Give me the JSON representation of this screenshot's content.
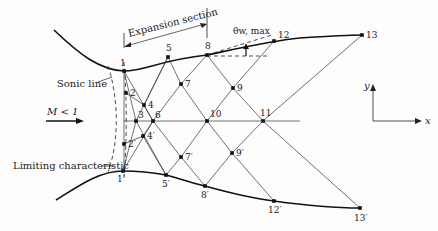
{
  "labels": {
    "expansion_section": "Expansion section",
    "sonic_line": "Sonic line",
    "limiting_characteristic": "Limiting characteristic",
    "mach": "M < 1",
    "theta": "θw, max",
    "axis_x": "x",
    "axis_y": "y"
  },
  "points": [
    {
      "id": "1",
      "x": 124,
      "y": 71
    },
    {
      "id": "2",
      "x": 126,
      "y": 93
    },
    {
      "id": "3",
      "x": 136,
      "y": 121
    },
    {
      "id": "4",
      "x": 144,
      "y": 105
    },
    {
      "id": "5",
      "x": 168,
      "y": 57
    },
    {
      "id": "6",
      "x": 153,
      "y": 121
    },
    {
      "id": "7",
      "x": 181,
      "y": 84
    },
    {
      "id": "8",
      "x": 207,
      "y": 55
    },
    {
      "id": "9",
      "x": 233,
      "y": 88
    },
    {
      "id": "10",
      "x": 207,
      "y": 121
    },
    {
      "id": "11",
      "x": 263,
      "y": 121
    },
    {
      "id": "12",
      "x": 274,
      "y": 41
    },
    {
      "id": "13",
      "x": 362,
      "y": 35
    },
    {
      "id": "1′",
      "x": 123,
      "y": 171
    },
    {
      "id": "2′",
      "x": 124,
      "y": 144
    },
    {
      "id": "4′",
      "x": 143,
      "y": 136
    },
    {
      "id": "5′",
      "x": 166,
      "y": 175
    },
    {
      "id": "7′",
      "x": 181,
      "y": 157
    },
    {
      "id": "8′",
      "x": 205,
      "y": 186
    },
    {
      "id": "9′",
      "x": 232,
      "y": 153
    },
    {
      "id": "12′",
      "x": 274,
      "y": 201
    },
    {
      "id": "13′",
      "x": 360,
      "y": 208
    }
  ]
}
